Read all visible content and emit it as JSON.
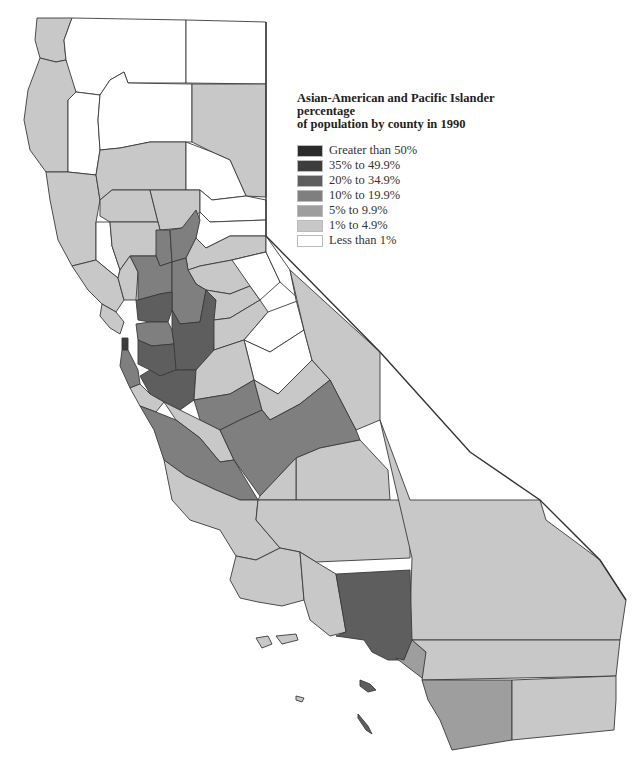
{
  "map": {
    "title": "Asian-American and Pacific Islander percentage of population by county in 1990",
    "title_line1": "Asian-American and Pacific Islander percentage",
    "title_line2": "of population by county in 1990",
    "region": "California",
    "legend": [
      {
        "label": "Greater than 50%",
        "color": "#2a2a2a"
      },
      {
        "label": "35% to 49.9%",
        "color": "#3d3d3d"
      },
      {
        "label": "20% to 34.9%",
        "color": "#5e5e5e"
      },
      {
        "label": "10% to 19.9%",
        "color": "#7f7f7f"
      },
      {
        "label": "5% to 9.9%",
        "color": "#9e9e9e"
      },
      {
        "label": "1% to 4.9%",
        "color": "#c8c8c8"
      },
      {
        "label": "Less than 1%",
        "color": "#ffffff"
      }
    ]
  }
}
